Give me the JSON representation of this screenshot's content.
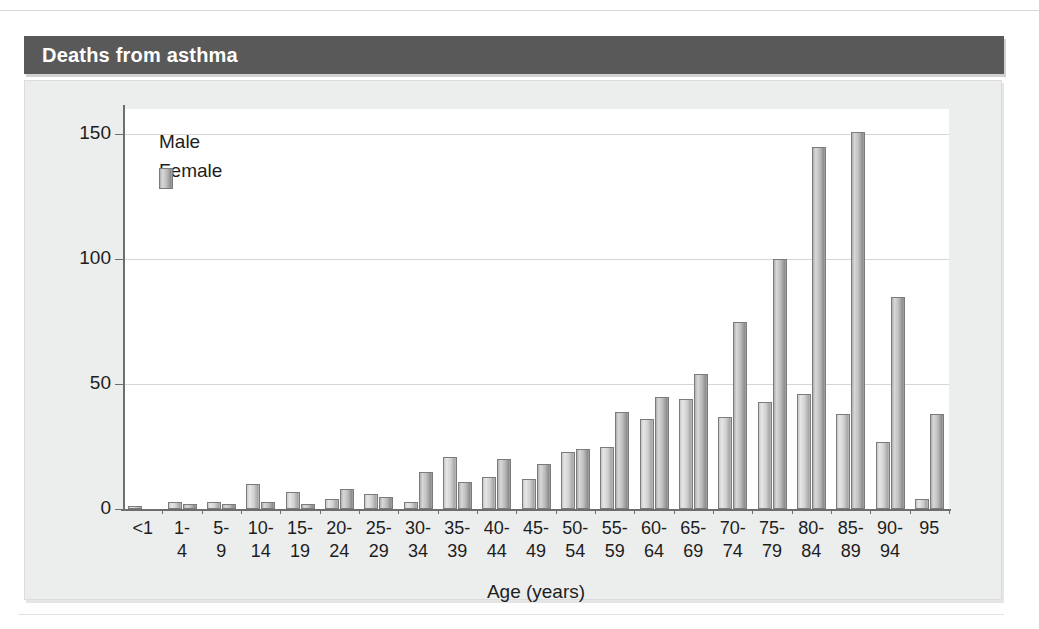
{
  "figure": {
    "title": "Deaths from asthma"
  },
  "chart_data": {
    "type": "bar",
    "title": "Deaths from asthma",
    "xlabel": "Age (years)",
    "ylabel": "",
    "ylim": [
      0,
      160
    ],
    "yticks": [
      0,
      50,
      100,
      150
    ],
    "ytick_labels": [
      "0",
      "50",
      "100",
      "150"
    ],
    "grid": true,
    "legend_position": "top-left",
    "categories": [
      "<1",
      "1-4",
      "5-9",
      "10-14",
      "15-19",
      "20-24",
      "25-29",
      "30-34",
      "35-39",
      "40-44",
      "45-49",
      "50-54",
      "55-59",
      "60-64",
      "65-69",
      "70-74",
      "75-79",
      "80-84",
      "85-89",
      "90-94",
      "95"
    ],
    "category_lines": [
      [
        "<1",
        ""
      ],
      [
        "1-",
        "4"
      ],
      [
        "5-",
        "9"
      ],
      [
        "10-",
        "14"
      ],
      [
        "15-",
        "19"
      ],
      [
        "20-",
        "24"
      ],
      [
        "25-",
        "29"
      ],
      [
        "30-",
        "34"
      ],
      [
        "35-",
        "39"
      ],
      [
        "40-",
        "44"
      ],
      [
        "45-",
        "49"
      ],
      [
        "50-",
        "54"
      ],
      [
        "55-",
        "59"
      ],
      [
        "60-",
        "64"
      ],
      [
        "65-",
        "69"
      ],
      [
        "70-",
        "74"
      ],
      [
        "75-",
        "79"
      ],
      [
        "80-",
        "84"
      ],
      [
        "85-",
        "89"
      ],
      [
        "90-",
        "94"
      ],
      [
        "95",
        ""
      ]
    ],
    "series": [
      {
        "name": "Male",
        "color": "#d2d2d2",
        "values": [
          1,
          3,
          3,
          10,
          7,
          4,
          6,
          3,
          21,
          13,
          12,
          23,
          25,
          36,
          44,
          37,
          43,
          46,
          38,
          27,
          4
        ]
      },
      {
        "name": "Female",
        "color": "#b0b0b0",
        "values": [
          0,
          2,
          2,
          3,
          2,
          8,
          5,
          15,
          11,
          20,
          18,
          24,
          39,
          45,
          54,
          75,
          100,
          145,
          151,
          85,
          38
        ]
      }
    ]
  },
  "legend": {
    "items": [
      {
        "label": "Male"
      },
      {
        "label": "Female"
      }
    ]
  },
  "colors": {
    "title_bar": "#595959",
    "panel_bg": "#eceded",
    "plot_bg": "#ffffff",
    "axis": "#6e6e6e",
    "grid": "#d6d6d6"
  }
}
